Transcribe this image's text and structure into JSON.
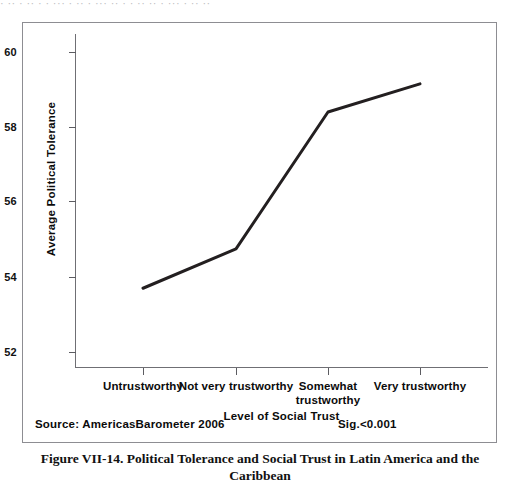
{
  "top_bleed_text": "· ·· · ·· · · ··· · ·· · ··· ·· · · ·· ·· · ··· · ·· ··",
  "footer": {
    "source_label": "Source: AmericasBarometer 2006",
    "significance_label": "Sig.<0.001"
  },
  "caption": "Figure VII-14.  Political Tolerance and Social Trust in Latin America and the Caribbean",
  "colors": {
    "series_line": "#231f20",
    "axis": "#6f6f74",
    "frame": "#8d8d92",
    "text": "#0b0b0b",
    "background": "#ffffff"
  },
  "chart_data": {
    "type": "line",
    "title": "",
    "xlabel": "Level of Social Trust",
    "ylabel": "Average Political Tolerance",
    "categories": [
      "Untrustworthy",
      "Not very trustworthy",
      "Somewhat trustworthy",
      "Very trustworthy"
    ],
    "values": [
      53.7,
      54.75,
      58.4,
      59.15
    ],
    "series": [
      {
        "name": "Average Political Tolerance",
        "values": [
          53.7,
          54.75,
          58.4,
          59.15
        ]
      }
    ],
    "ylim": [
      51.4,
      60.5
    ],
    "yticks": [
      52,
      54,
      56,
      58,
      60
    ],
    "ytick_labels": [
      "52",
      "54",
      "56",
      "58",
      "60"
    ],
    "xticks": [
      1,
      2,
      3,
      4
    ],
    "grid": false,
    "legend": false,
    "markers": false,
    "line_width": 3
  }
}
